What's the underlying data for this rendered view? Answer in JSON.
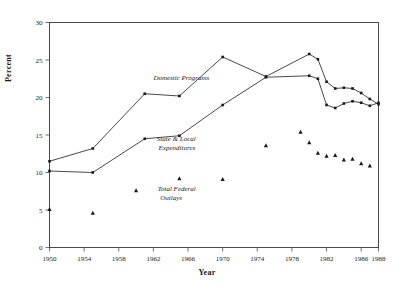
{
  "chart_data": {
    "type": "line",
    "title": "",
    "xlabel": "Year",
    "ylabel": "Percent",
    "xlim": [
      1950,
      1988
    ],
    "ylim": [
      0,
      30
    ],
    "yticks": [
      0,
      5,
      10,
      15,
      20,
      25,
      30
    ],
    "xticks": [
      1950,
      1954,
      1958,
      1962,
      1966,
      1970,
      1974,
      1978,
      1982,
      1986,
      1988
    ],
    "grid": false,
    "legend_position": "inline-annotations",
    "annotations": [
      {
        "text": "Domestic Programs",
        "x": 1962,
        "y": 22.3
      },
      {
        "text": "State & Local",
        "x": 1962.4,
        "y": 14.2
      },
      {
        "text": "Expenditures",
        "x": 1962.6,
        "y": 13.0
      },
      {
        "text": "Total Federal",
        "x": 1962.5,
        "y": 7.6
      },
      {
        "text": "Outlays",
        "x": 1962.8,
        "y": 6.4
      }
    ],
    "series": [
      {
        "name": "Domestic Programs",
        "marker": "square",
        "style": "line",
        "points": [
          [
            1950,
            11.5
          ],
          [
            1955,
            13.2
          ],
          [
            1961,
            20.5
          ],
          [
            1965,
            20.2
          ],
          [
            1970,
            25.4
          ],
          [
            1975,
            22.8
          ],
          [
            1980,
            25.8
          ],
          [
            1981,
            25.1
          ],
          [
            1982,
            22.1
          ],
          [
            1983,
            21.2
          ],
          [
            1984,
            21.3
          ],
          [
            1985,
            21.2
          ],
          [
            1986,
            20.6
          ],
          [
            1987,
            19.8
          ],
          [
            1988,
            19.1
          ]
        ]
      },
      {
        "name": "State & Local Expenditures",
        "marker": "square",
        "style": "line",
        "points": [
          [
            1950,
            10.2
          ],
          [
            1955,
            10.0
          ],
          [
            1961,
            14.5
          ],
          [
            1965,
            14.9
          ],
          [
            1970,
            19.0
          ],
          [
            1975,
            22.7
          ],
          [
            1980,
            22.9
          ],
          [
            1981,
            22.5
          ],
          [
            1982,
            19.0
          ],
          [
            1983,
            18.6
          ],
          [
            1984,
            19.2
          ],
          [
            1985,
            19.5
          ],
          [
            1986,
            19.3
          ],
          [
            1987,
            18.9
          ],
          [
            1988,
            19.3
          ]
        ]
      },
      {
        "name": "Total Federal Outlays",
        "marker": "triangle",
        "style": "points",
        "points": [
          [
            1950,
            5.1
          ],
          [
            1955,
            4.6
          ],
          [
            1960,
            7.6
          ],
          [
            1965,
            9.2
          ],
          [
            1970,
            9.1
          ],
          [
            1975,
            13.6
          ],
          [
            1979,
            15.4
          ],
          [
            1980,
            14.0
          ],
          [
            1981,
            12.6
          ],
          [
            1982,
            12.2
          ],
          [
            1983,
            12.3
          ],
          [
            1984,
            11.7
          ],
          [
            1985,
            11.8
          ],
          [
            1986,
            11.2
          ],
          [
            1987,
            10.9
          ]
        ]
      }
    ]
  },
  "axis": {
    "ylabel_text": "Percent",
    "xlabel_text": "Year"
  }
}
